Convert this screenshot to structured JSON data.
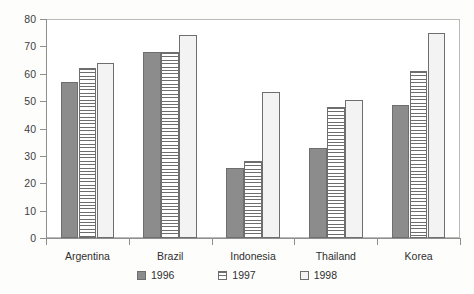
{
  "chart_data": {
    "type": "bar",
    "title": "",
    "subtitle": "",
    "xlabel": "",
    "ylabel": "",
    "ylim": [
      0,
      80
    ],
    "ytick_step": 10,
    "yticks": [
      80,
      70,
      60,
      50,
      40,
      30,
      20,
      10,
      0
    ],
    "grid": false,
    "legend_position": "bottom-center",
    "categories": [
      "Argentina",
      "Brazil",
      "Indonesia",
      "Thailand",
      "Korea"
    ],
    "series": [
      {
        "name": "1996",
        "pattern": "solid",
        "color": "#8c8c8c",
        "values": [
          57,
          68,
          25.5,
          33,
          48.5
        ]
      },
      {
        "name": "1997",
        "pattern": "horizontal-lines",
        "color": "#ffffff",
        "values": [
          62,
          68,
          28,
          48,
          61
        ]
      },
      {
        "name": "1998",
        "pattern": "dots",
        "color": "#f3f3f3",
        "values": [
          64,
          74,
          53.5,
          50.5,
          75
        ]
      }
    ]
  },
  "axis": {
    "y_labels": [
      "80",
      "70",
      "60",
      "50",
      "40",
      "30",
      "20",
      "10",
      "0"
    ],
    "x_labels": [
      "Argentina",
      "Brazil",
      "Indonesia",
      "Thailand",
      "Korea"
    ]
  },
  "legend": {
    "items": [
      {
        "label": "1996",
        "pattern": "solid"
      },
      {
        "label": "1997",
        "pattern": "horizontal-lines"
      },
      {
        "label": "1998",
        "pattern": "dots"
      }
    ]
  },
  "colors": {
    "bar_solid": "#8c8c8c",
    "bar_outline": "#6e6e6e",
    "axis": "#8f8f8f",
    "frame": "#b9b9b9",
    "text": "#2f2f2f",
    "background": "#fdfdfc"
  }
}
